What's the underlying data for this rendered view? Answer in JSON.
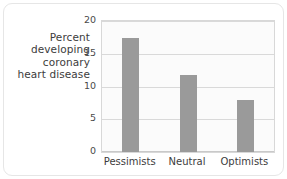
{
  "chart_data": {
    "type": "bar",
    "title": "",
    "xlabel": "",
    "ylabel": "Percent developing coronary heart disease",
    "ylabel_lines": [
      "Percent",
      "developing",
      "coronary",
      "heart disease"
    ],
    "categories": [
      "Pessimists",
      "Neutral",
      "Optimists"
    ],
    "values": [
      17.4,
      11.8,
      8.0
    ],
    "ylim": [
      0,
      20
    ],
    "yticks": [
      0,
      5,
      10,
      15,
      20
    ],
    "ytick_labels": [
      "0",
      "5",
      "10",
      "15",
      "20"
    ],
    "grid": "horizontal",
    "legend": "none",
    "bar_color": "#9a9a9a",
    "plot_background": "#fbfbfb",
    "frame_color": "#d8d8d8",
    "gridline_color": "#d9d9d9",
    "card_border_color": "#e6e6e6",
    "text_color": "#3c3c3c"
  }
}
